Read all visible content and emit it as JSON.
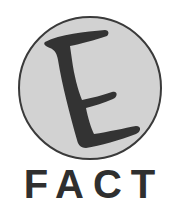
{
  "logo": {
    "emblem_letter": "E",
    "wordmark": "FACT",
    "colors": {
      "circle_fill": "#d2d2d2",
      "circle_stroke": "#3a3a3a",
      "letter": "#333333",
      "background": "#ffffff"
    }
  }
}
